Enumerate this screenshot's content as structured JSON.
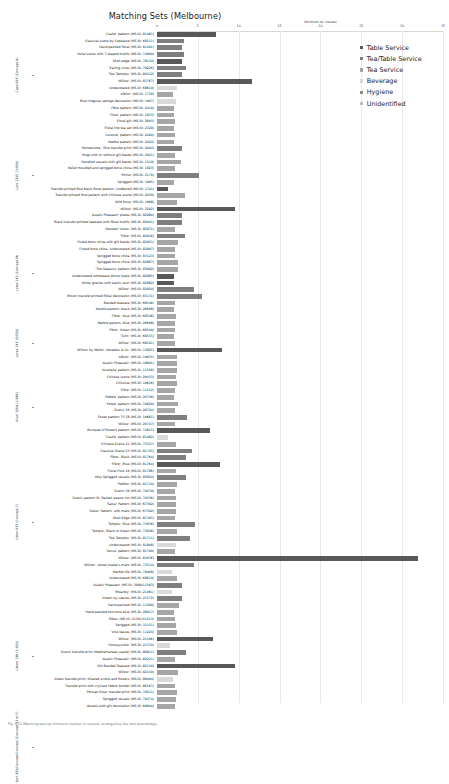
{
  "chart_data": {
    "type": "bar",
    "orientation": "horizontal",
    "title": "Matching Sets (Melbourne)",
    "xlabel": "Minimum no. Vessels",
    "ylabel": "",
    "xlim": [
      0,
      35
    ],
    "xticks": [
      0,
      5,
      10,
      15,
      20,
      25,
      30,
      35
    ],
    "grid": true,
    "legend_position": "right",
    "legend": [
      {
        "name": "Table Service",
        "color": "#595959"
      },
      {
        "name": "Tea/Table Service",
        "color": "#7f7f7f"
      },
      {
        "name": "Tea Service",
        "color": "#a6a6a6"
      },
      {
        "name": "Beverage",
        "color": "#d9d9d9"
      },
      {
        "name": "Hygiene",
        "color": "#8c8c8c"
      },
      {
        "name": "Unidentified",
        "color": "#bfbfbf"
      }
    ],
    "groups": [
      {
        "label": "Casa 097 (Concept A)",
        "count": 13
      },
      {
        "label": "Lots 17VC (1:050)",
        "count": 17
      },
      {
        "label": "Lores 143 (Concept M)",
        "count": 12
      },
      {
        "label": "Lores 147 (2:722)",
        "count": 9
      },
      {
        "label": "Uturi 156A (1:789)",
        "count": 10
      },
      {
        "label": "Litton 073 (Concept T)",
        "count": 24
      },
      {
        "label": "Littom 128 (1:023)",
        "count": 16
      },
      {
        "label": "Sprt 255/Concept/Concept (Concept 33 m F)",
        "count": 11
      }
    ],
    "categories": [
      "'Castle' pattern (MS ID: 81461)",
      "Classical scene by Copeland (MS ID: 68511)",
      "Hand-painted floral (MS ID: 81491)",
      "Rural scene with T-shaped motifs (MS ID: 74909)",
      "Shell-edge (MS ID: 78134)",
      "Trailing vines (MS ID: 78226)",
      "'Two Temples' (MS ID: 80312)",
      "'Willow' (MS ID: 83767)",
      "Undecorated (MS ID: 68610)",
      "'Albion' (MS ID: 1739)",
      "Blue irregular sponge decoration (MS ID: 1907)",
      "Fibre pattern (MS ID: 2410)",
      "'Flora' pattern (MS ID: 1833)",
      "Floral gilt (MS ID: 2693)",
      "Floral trip tea set (MS ID: 2329)",
      "'Lucerne' pattern (MS ID: 2494)",
      "Marble pattern (MS ID: 2424)",
      "'Montezuma', flow transfer-print (MS ID: 2044)",
      "Mugs with or without gilt bands (MS ID: 2921)",
      "Panelled vessels with gilt bands (MS ID: 1519)",
      "Relief moulded and sprigged bone china (MS ID: 1823)",
      "'Rhine' (MS ID: 2170)",
      "Sprigged (MS ID: 1995)",
      "Transfer-printed flow black floral pattern, clobbered (MS ID: 1741)",
      "Transfer-printed flow pattern with Chinese scene (MS ID: 2050)",
      "'Wild Rose' (MS ID: 1968)",
      "'Willow' (MS ID: 2292)",
      "'Asiatic Pheasant' plates (MS ID: 82980)",
      "Black transfer-printed teaware with floral motifs (MS ID: 82941)",
      "'Dresden Views' (MS ID: 82971)",
      "'Fibre' (MS ID: 82916)",
      "Fluted bone china with gilt bands (MS ID: 82951)",
      "Fluted bone china, undecorated (MS ID: 82897)",
      "Sprigged bone china (MS ID: 83123)",
      "Sprigged bone china (MS ID: 82887)",
      "'The Seasons' pattern (MS ID: 83002)",
      "Undecorated whiteware dinner plate (MS ID: 82885)",
      "White granite with kaolin swirl (MS ID: 82882)",
      "'Willow' (MS ID: 82850)",
      "Brown transfer-printed floral decoration (MS ID: 83131)",
      "Banded teaware (MS ID: 68546)",
      "Marble pattern, black (MS ID: 26698)",
      "'Fibre', blue (MS ID: 68546)",
      "Marble pattern, blue (MS ID: 26698)",
      "'Fibre', Green (MS ID: 68549)",
      "'Turin' (MS ID: 68555)",
      "'Willow' (MS ID: 68521)",
      "'Willow' by Mellor, Venables & Co. (MS ID: 15825)",
      "'Albion' (MS ID: 19635)",
      "'Asiatic Pheasant' (MS ID: 18691)",
      "'Australia' pattern (MS ID: 11556)",
      "Chinese scene (MS ID: 20433)",
      "Chinoise (MS ID: 10616)",
      "'Fibre' (MS ID: 11512)",
      "'Pebble' pattern (MS ID: 20726)",
      "'Pelew' pattern (MS ID: 10629)",
      "Scenic 56 (MS ID: 20724)",
      "Sheet pattern 75 58 (MS ID: 10661)",
      "'Willow' (MS ID: 20747)",
      "Bouquet of flowers pattern (MS ID: 74815)",
      "'Castle' pattern (MS ID: 81462)",
      "Chinese Scene 21 (MS ID: 75527)",
      "Classical Scene 53 (MS ID: 81745)",
      "'Fibre', Black (MS ID: 81764)",
      "'Fibre', Blue (MS ID: 81764)",
      "Floral Flow 16 (MS ID: 81786)",
      "Miss Sprigged vessels (MS ID: 85824)",
      "'Pebble' (MS ID: 81710)",
      "Scenic 56 (MS ID: 70279)",
      "Scenic pattern St. Basket weave rim (MS ID: 70536)",
      "'Satsu' Pattern (MS ID: 67302)",
      "'Setso' Pattern, with mark (MS ID: 67302)",
      "Shell-Edge (MS ID: 81765)",
      "'Temple', Blue (MS ID: 75836)",
      "'Temple', Black or Green (MS ID: 75836)",
      "'Two Temples' (MS ID: 81711)",
      "Undecorated (MS ID: 81808)",
      "'Venus' pattern (MS ID: 81709)",
      "'Willow' (MS ID: 81636)",
      "'Willow', wheel-maker's mark (MS ID: 73514)",
      "Marble tile (MS ID: 79468)",
      "Undecorated (MS ID: 68619)",
      "'Asiatic Pheasant' (MS ID: 3080/11563)",
      "'Brearley' (MS ID: 21461)",
      "Green Ivy Leaves (MS ID: 21572)",
      "Hand-painted (MS ID: 11200)",
      "Hand-painted two tone blue (MS ID: 26917)",
      "'Ribes' (MS ID: 21391/51213)",
      "Sprigged (MS ID: 31151)",
      "Vine leaves (MS ID: 11224)",
      "'Willow' (MS ID: 21506)",
      "'Honeysuckle' (MS ID: 21370)",
      "Scenic transfer-print (Mediterranean castle) (MS ID: 80811)",
      "'Asiatic Pheasant' (MS ID: 82215)",
      "Gilt Banded Teaware (MS ID: 82139)",
      "'Willow' (MS ID: 82150)",
      "Green transfer-print, foliated scrolls and flowers (MS ID: 86094)",
      "Transfer-print with crylised ribbon border (MS ID: 86167)",
      "'Persian Rose' transfer-print (MS ID: 79211)",
      "Sprigged vessels (MS ID: 79374)",
      "Vessels with gilt decoration (MS ID: 69694)"
    ],
    "values": [
      7.2,
      3.3,
      3.0,
      3.3,
      3.1,
      3.5,
      3.0,
      11.6,
      2.5,
      1.9,
      2.3,
      2.1,
      2.1,
      2.2,
      2.1,
      2.2,
      2.1,
      3.1,
      2.2,
      2.9,
      2.2,
      5.1,
      2.1,
      1.4,
      3.4,
      2.5,
      9.6,
      3.1,
      3.0,
      2.2,
      3.4,
      2.6,
      2.2,
      2.2,
      2.6,
      2.6,
      2.1,
      2.1,
      4.5,
      5.5,
      2.2,
      2.1,
      2.3,
      2.2,
      2.2,
      2.1,
      2.2,
      8.0,
      2.4,
      2.4,
      2.4,
      2.3,
      2.5,
      2.2,
      2.1,
      2.6,
      2.2,
      3.7,
      2.2,
      6.5,
      1.3,
      2.3,
      4.3,
      3.5,
      7.7,
      2.3,
      3.6,
      2.4,
      2.2,
      2.3,
      2.3,
      2.3,
      2.2,
      4.6,
      2.4,
      4.0,
      2.3,
      2.2,
      32.0,
      4.5,
      1.8,
      2.4,
      3.0,
      1.8,
      3.1,
      2.7,
      2.1,
      2.2,
      2.3,
      2.4,
      6.8,
      1.6,
      3.6,
      2.2,
      9.5,
      2.6,
      1.9,
      2.2,
      2.4,
      2.3,
      2.2
    ],
    "value_categories": [
      "Table Service",
      "Tea/Table Service",
      "Tea/Table Service",
      "Tea/Table Service",
      "Table Service",
      "Tea/Table Service",
      "Tea/Table Service",
      "Table Service",
      "Beverage",
      "Tea Service",
      "Beverage",
      "Tea Service",
      "Tea Service",
      "Tea Service",
      "Tea Service",
      "Tea Service",
      "Tea Service",
      "Tea/Table Service",
      "Tea Service",
      "Tea Service",
      "Tea Service",
      "Tea/Table Service",
      "Tea Service",
      "Table Service",
      "Tea Service",
      "Tea Service",
      "Table Service",
      "Tea/Table Service",
      "Tea/Table Service",
      "Tea Service",
      "Tea/Table Service",
      "Tea Service",
      "Tea Service",
      "Tea Service",
      "Tea Service",
      "Tea Service",
      "Table Service",
      "Table Service",
      "Tea/Table Service",
      "Tea/Table Service",
      "Tea Service",
      "Tea Service",
      "Tea Service",
      "Tea Service",
      "Tea Service",
      "Tea Service",
      "Tea Service",
      "Table Service",
      "Tea Service",
      "Tea Service",
      "Tea Service",
      "Tea Service",
      "Tea Service",
      "Tea Service",
      "Tea Service",
      "Tea Service",
      "Tea Service",
      "Tea/Table Service",
      "Tea Service",
      "Table Service",
      "Beverage",
      "Tea Service",
      "Tea/Table Service",
      "Tea/Table Service",
      "Table Service",
      "Tea Service",
      "Tea/Table Service",
      "Tea Service",
      "Tea Service",
      "Tea Service",
      "Tea Service",
      "Tea Service",
      "Tea Service",
      "Tea/Table Service",
      "Tea Service",
      "Tea/Table Service",
      "Beverage",
      "Tea Service",
      "Table Service",
      "Tea/Table Service",
      "Beverage",
      "Tea Service",
      "Tea/Table Service",
      "Beverage",
      "Tea/Table Service",
      "Tea Service",
      "Tea Service",
      "Tea Service",
      "Tea Service",
      "Tea Service",
      "Table Service",
      "Beverage",
      "Tea/Table Service",
      "Tea Service",
      "Table Service",
      "Tea Service",
      "Beverage",
      "Tea Service",
      "Tea Service",
      "Tea Service",
      "Tea Service"
    ]
  },
  "caption": "Fig. 4.13 Matching sets by minimum number of vessels, arranged by site and assemblage."
}
